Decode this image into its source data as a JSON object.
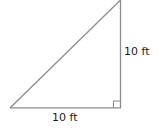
{
  "figure": {
    "type": "right-triangle",
    "stroke_color": "#8c8c8c",
    "background": "#ffffff",
    "vertices": {
      "bottom_left": [
        10,
        108
      ],
      "bottom_right": [
        120,
        108
      ],
      "top": [
        120,
        0
      ]
    },
    "right_angle_marker": {
      "corner": "bottom_right",
      "size": 7
    },
    "labels": {
      "height": "10 ft",
      "base": "10 ft"
    }
  }
}
